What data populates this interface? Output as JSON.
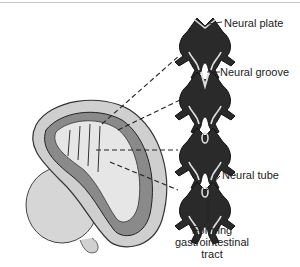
{
  "diagram": {
    "labels": {
      "neural_plate": "Neural plate",
      "neural_groove": "Neural groove",
      "neural_tube": "Neural tube",
      "gi_tract_line1": "Forming",
      "gi_tract_line2": "gastrointestinal",
      "gi_tract_line3": "tract"
    },
    "stages": [
      {
        "name": "neural-plate-stage",
        "y": 14
      },
      {
        "name": "neural-groove-stage",
        "y": 68
      },
      {
        "name": "closing-groove-stage",
        "y": 124
      },
      {
        "name": "neural-tube-stage",
        "y": 178
      }
    ],
    "colors": {
      "tissue_dark": "#2a2a2a",
      "tissue_light": "#d8d8d8",
      "embryo_fill": "#cfcfcf",
      "embryo_dark": "#8a8a8a",
      "line": "#333333",
      "border": "#c8c8c8"
    }
  }
}
